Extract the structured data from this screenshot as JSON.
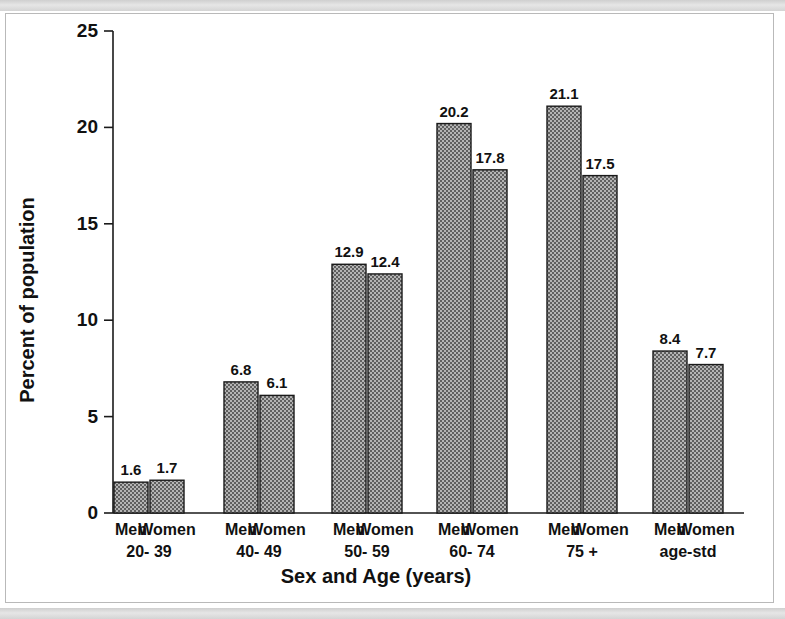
{
  "chart_data": {
    "type": "bar",
    "title": "",
    "xlabel": "Sex and Age (years)",
    "ylabel": "Percent of population",
    "ylim": [
      0,
      25
    ],
    "yticks": [
      0,
      5,
      10,
      15,
      20,
      25
    ],
    "ytick_labels": [
      "0",
      "5",
      "10",
      "15",
      "20",
      "25"
    ],
    "grid": false,
    "legend": "none",
    "categories": [
      "20- 39",
      "40- 49",
      "50- 59",
      "60- 74",
      "75 +",
      "age-std"
    ],
    "series": [
      {
        "name": "Men",
        "values": [
          1.6,
          6.8,
          12.9,
          20.2,
          21.1,
          8.4
        ]
      },
      {
        "name": "Women",
        "values": [
          1.7,
          6.1,
          12.4,
          17.8,
          17.5,
          7.7
        ]
      }
    ],
    "bars": [
      {
        "group": "20- 39",
        "sex": "Men",
        "value": 1.6,
        "label": "1.6"
      },
      {
        "group": "20- 39",
        "sex": "Women",
        "value": 1.7,
        "label": "1.7"
      },
      {
        "group": "40- 49",
        "sex": "Men",
        "value": 6.8,
        "label": "6.8"
      },
      {
        "group": "40- 49",
        "sex": "Women",
        "value": 6.1,
        "label": "6.1"
      },
      {
        "group": "50- 59",
        "sex": "Men",
        "value": 12.9,
        "label": "12.9"
      },
      {
        "group": "50- 59",
        "sex": "Women",
        "value": 12.4,
        "label": "12.4"
      },
      {
        "group": "60- 74",
        "sex": "Men",
        "value": 20.2,
        "label": "20.2"
      },
      {
        "group": "60- 74",
        "sex": "Women",
        "value": 17.8,
        "label": "17.8"
      },
      {
        "group": "75 +",
        "sex": "Men",
        "value": 21.1,
        "label": "21.1"
      },
      {
        "group": "75 +",
        "sex": "Women",
        "value": 17.5,
        "label": "17.5"
      },
      {
        "group": "age-std",
        "sex": "Men",
        "value": 8.4,
        "label": "8.4"
      },
      {
        "group": "age-std",
        "sex": "Women",
        "value": 7.7,
        "label": "7.7"
      }
    ],
    "colors": {
      "bar_fill": "#8d8d8d",
      "bar_edge": "#1a1a1a",
      "axis": "#1a1a1a",
      "text": "#111111",
      "background": "#ffffff",
      "frame_border": "#b9b9b9",
      "scan_band": "#d9d9d9"
    }
  }
}
